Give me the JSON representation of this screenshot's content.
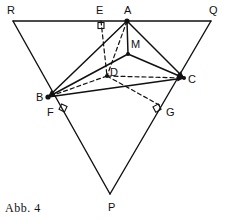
{
  "figure": {
    "caption": "Abb. 4",
    "stroke_color": "#111111",
    "background_color": "#ffffff",
    "points": {
      "R": {
        "label": "R",
        "x": 13,
        "y": 21,
        "lx": 7,
        "ly": 14
      },
      "Q": {
        "label": "Q",
        "x": 211,
        "y": 21,
        "lx": 209,
        "ly": 14
      },
      "P": {
        "label": "P",
        "x": 110,
        "y": 194,
        "lx": 108,
        "ly": 211
      },
      "A": {
        "label": "A",
        "x": 127,
        "y": 21,
        "lx": 124,
        "ly": 14
      },
      "B": {
        "label": "B",
        "x": 48,
        "y": 97,
        "lx": 36,
        "ly": 101
      },
      "C": {
        "label": "C",
        "x": 184,
        "y": 78,
        "lx": 188,
        "ly": 83
      },
      "M": {
        "label": "M",
        "x": 128,
        "y": 54,
        "lx": 131,
        "ly": 48
      },
      "D": {
        "label": "D",
        "x": 107,
        "y": 76,
        "lx": 110,
        "ly": 76
      },
      "E": {
        "label": "E",
        "x": 101,
        "y": 21,
        "lx": 96,
        "ly": 14
      },
      "F": {
        "label": "F",
        "x": 59,
        "y": 106,
        "lx": 47,
        "ly": 116
      },
      "G": {
        "label": "G",
        "x": 161,
        "y": 106,
        "lx": 166,
        "ly": 116
      }
    },
    "solid_edges": [
      {
        "name": "edge-R-Q",
        "from": "R",
        "to": "Q"
      },
      {
        "name": "edge-R-P",
        "from": "R",
        "to": "P"
      },
      {
        "name": "edge-Q-P",
        "from": "Q",
        "to": "P"
      },
      {
        "name": "edge-A-B",
        "from": "A",
        "to": "B"
      },
      {
        "name": "edge-A-C",
        "from": "A",
        "to": "C"
      },
      {
        "name": "edge-B-C",
        "from": "B",
        "to": "C"
      },
      {
        "name": "edge-A-M",
        "from": "A",
        "to": "M"
      },
      {
        "name": "edge-M-B",
        "from": "M",
        "to": "B"
      },
      {
        "name": "edge-M-C",
        "from": "M",
        "to": "C"
      }
    ],
    "dashed_edges": [
      {
        "name": "edge-A-D",
        "from": "A",
        "to": "D"
      },
      {
        "name": "edge-D-B",
        "from": "D",
        "to": "B"
      },
      {
        "name": "edge-D-C",
        "from": "D",
        "to": "C"
      },
      {
        "name": "edge-E-D",
        "from": "E",
        "to": "D"
      },
      {
        "name": "edge-D-G",
        "from": "D",
        "to": "G"
      }
    ],
    "right_angle_marks": [
      {
        "name": "right-angle-at-E",
        "x": 101,
        "y": 21,
        "rot": 0
      },
      {
        "name": "right-angle-at-F",
        "x": 59,
        "y": 106,
        "rot": -64
      },
      {
        "name": "right-angle-at-G",
        "x": 161,
        "y": 106,
        "rot": 62
      }
    ],
    "vertex_dots": [
      "A",
      "B",
      "C",
      "M",
      "D"
    ],
    "arrowed_edges": [
      "edge-A-B",
      "edge-A-C",
      "edge-B-C",
      "edge-M-B",
      "edge-M-C",
      "edge-D-B"
    ]
  }
}
